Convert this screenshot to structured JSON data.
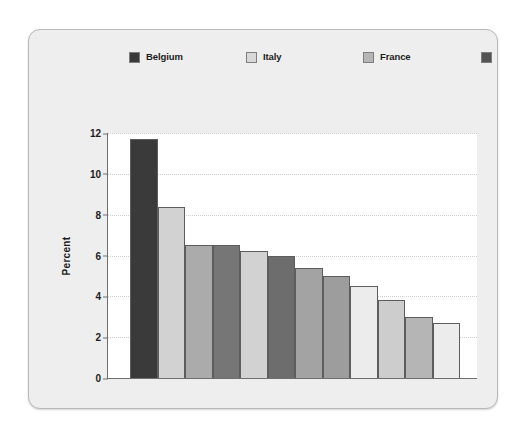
{
  "chart_data": {
    "type": "bar",
    "title": "",
    "subtitle": "",
    "xlabel": "",
    "ylabel": "Percent",
    "ylim": [
      0,
      12
    ],
    "yticks": [
      0,
      2,
      4,
      6,
      8,
      10,
      12
    ],
    "grid": true,
    "legend_position": "top",
    "legend_columns": 3,
    "categories": [
      "Belgium",
      "Italy",
      "France",
      "West Germany",
      "Spain",
      "Britain",
      "Denmark",
      "Netherlands",
      "United States",
      "Northern Ireland",
      "Canada",
      "Ireland"
    ],
    "series": [
      {
        "name": "Percent",
        "values": [
          11.7,
          8.4,
          6.5,
          6.5,
          6.2,
          6.0,
          5.4,
          5.0,
          4.5,
          3.8,
          3.0,
          2.7
        ]
      }
    ],
    "bars": [
      {
        "label": "Belgium",
        "value": 11.7,
        "color": "#3a3a3a"
      },
      {
        "label": "Italy",
        "value": 8.4,
        "color": "#d2d2d2"
      },
      {
        "label": "France",
        "value": 6.5,
        "color": "#ababab"
      },
      {
        "label": "West Germany",
        "value": 6.5,
        "color": "#767676"
      },
      {
        "label": "Spain",
        "value": 6.2,
        "color": "#d2d2d2"
      },
      {
        "label": "Britain",
        "value": 6.0,
        "color": "#6d6d6d"
      },
      {
        "label": "Denmark",
        "value": 5.4,
        "color": "#a3a3a3"
      },
      {
        "label": "Netherlands",
        "value": 5.0,
        "color": "#9d9d9d"
      },
      {
        "label": "United States",
        "value": 4.5,
        "color": "#ececec"
      },
      {
        "label": "Northern Ireland",
        "value": 3.8,
        "color": "#cdcdcd"
      },
      {
        "label": "Canada",
        "value": 3.0,
        "color": "#b5b5b5"
      },
      {
        "label": "Ireland",
        "value": 2.7,
        "color": "#ececec"
      }
    ]
  },
  "legend": {
    "items": [
      {
        "label": "Belgium",
        "color": "#3a3a3a"
      },
      {
        "label": "Italy",
        "color": "#d8d8d8"
      },
      {
        "label": "France",
        "color": "#b6b6b6"
      },
      {
        "label": "West Germany",
        "color": "#535353"
      },
      {
        "label": "Spain",
        "color": "#cfcfcf"
      },
      {
        "label": "Britain",
        "color": "#555555"
      },
      {
        "label": "Denmark",
        "color": "#b0b0b0"
      },
      {
        "label": "Netherlands",
        "color": "#a0a0a0"
      },
      {
        "label": "United States",
        "color": "#f2f2f2"
      },
      {
        "label": "Northern Ireland",
        "color": "#c9c9c9"
      },
      {
        "label": "Canada",
        "color": "#ababab"
      },
      {
        "label": "Ireland",
        "color": "#f2f2f2"
      }
    ]
  },
  "axis": {
    "y_label": "Percent",
    "y_ticks": [
      "12",
      "10",
      "8",
      "6",
      "4",
      "2",
      "0"
    ]
  },
  "colors": {
    "figure_background": "#eeeeee",
    "plot_background": "#ffffff",
    "axis_line": "#6e6e6e",
    "gridline": "#cfcfcf",
    "text": "#1c1c1c"
  }
}
